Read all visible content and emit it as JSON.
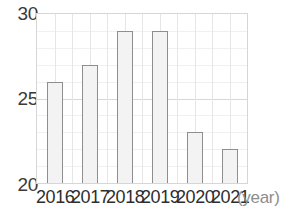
{
  "chart_data": {
    "type": "bar",
    "title": "",
    "subtitle": "",
    "xlabel": "(year)",
    "ylabel": "",
    "categories": [
      "2016",
      "2017",
      "2018",
      "2019",
      "2020",
      "2021"
    ],
    "values": [
      26,
      27,
      29,
      29,
      23,
      22
    ],
    "series": [
      {
        "name": "",
        "values": [
          26,
          27,
          29,
          29,
          23,
          22
        ]
      }
    ],
    "ylim": [
      20,
      30
    ],
    "xlim": [
      0,
      6
    ],
    "y_ticks": [
      20,
      25,
      30
    ],
    "y_tick_labels": [
      "20",
      "25",
      "30"
    ],
    "y_minor_tick_step": 1,
    "x_tick_labels": [
      "2016",
      "2017",
      "2018",
      "2019",
      "2020",
      "2021"
    ],
    "grid": true,
    "grid_axis": "both",
    "legend": false,
    "legend_position": "none",
    "annotations": [],
    "colors": {
      "bar_fill": "#f3f3f3",
      "bar_border": "#8e8e8e",
      "grid_minor": "#f0f0f0",
      "grid_major": "#d8d8d8",
      "grid_vertical": "#e6e6e6",
      "plot_frame": "#d6d6d6",
      "y_tick_text": "#3a3a3a",
      "x_tick_text": "#2e2e2e",
      "axis_unit_text": "#8d8d8d",
      "background": "#ffffff"
    }
  },
  "axis": {
    "y_labels": {
      "top": "30",
      "middle": "25",
      "bottom": "20"
    },
    "x_unit_label": "(year)"
  },
  "bars": [
    {
      "category": "2016",
      "value": 26,
      "label": "2016"
    },
    {
      "category": "2017",
      "value": 27,
      "label": "2017"
    },
    {
      "category": "2018",
      "value": 29,
      "label": "2018"
    },
    {
      "category": "2019",
      "value": 29,
      "label": "2019"
    },
    {
      "category": "2020",
      "value": 23,
      "label": "2020"
    },
    {
      "category": "2021",
      "value": 22,
      "label": "2021"
    }
  ]
}
